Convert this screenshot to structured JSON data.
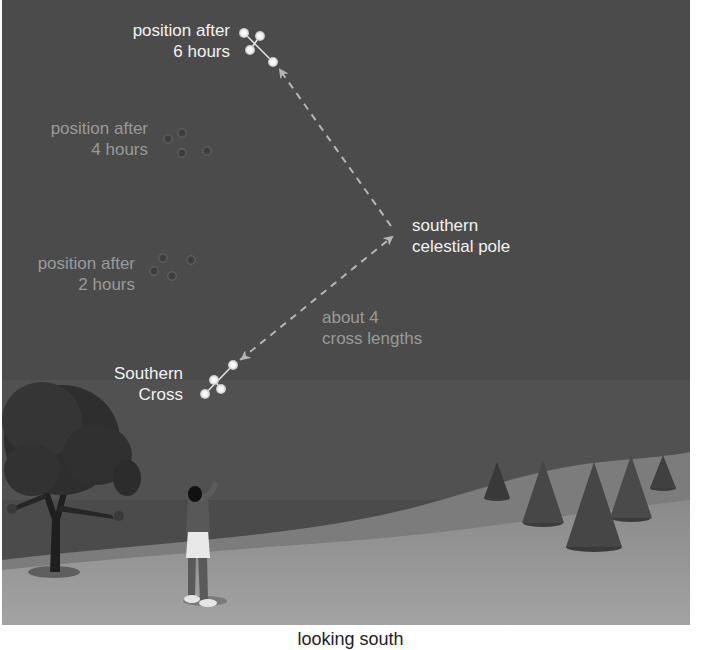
{
  "figure": {
    "caption": "looking south",
    "colors": {
      "sky": "#4a4a4a",
      "ground": "#9c9c9c",
      "far_ground": "#808080",
      "bright_text": "#f2f2f2",
      "dim_text": "#9a9a9a",
      "star": "#f4f4f4",
      "dashed_arrow": "#b5b5b5"
    }
  },
  "labels": {
    "pos6": {
      "line1": "position after",
      "line2": "6 hours"
    },
    "pos4": {
      "line1": "position after",
      "line2": "4 hours"
    },
    "pos2": {
      "line1": "position after",
      "line2": "2 hours"
    },
    "cross": {
      "line1": "Southern",
      "line2": "Cross"
    },
    "pole": {
      "line1": "southern",
      "line2": "celestial pole"
    },
    "distance": {
      "line1": "about 4",
      "line2": "cross lengths"
    }
  },
  "constellation_positions": [
    {
      "name": "Southern Cross (now)",
      "stars": [
        [
          231,
          365
        ],
        [
          212,
          380
        ],
        [
          219,
          389
        ],
        [
          203,
          394
        ]
      ],
      "bright": true
    },
    {
      "name": "after 2 hours",
      "stars": [
        [
          161,
          258
        ],
        [
          189,
          260
        ],
        [
          152,
          271
        ],
        [
          170,
          276
        ]
      ],
      "bright": false
    },
    {
      "name": "after 4 hours",
      "stars": [
        [
          180,
          133
        ],
        [
          166,
          139
        ],
        [
          180,
          153
        ],
        [
          205,
          151
        ]
      ],
      "bright": false
    },
    {
      "name": "after 6 hours",
      "stars": [
        [
          242,
          33
        ],
        [
          258,
          36
        ],
        [
          248,
          50
        ],
        [
          271,
          62
        ]
      ],
      "bright": true
    }
  ],
  "pole_point": [
    391,
    231
  ]
}
